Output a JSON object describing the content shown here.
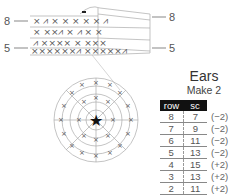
{
  "pattern": {
    "title": "Ears",
    "subtitle": "Make 2",
    "table": {
      "headers": {
        "row": "row",
        "sc": "sc"
      },
      "rows": [
        {
          "row": "8",
          "sc": "7",
          "note": "(−2)"
        },
        {
          "row": "7",
          "sc": "9",
          "note": "(−2)"
        },
        {
          "row": "6",
          "sc": "11",
          "note": "(−2)"
        },
        {
          "row": "5",
          "sc": "13",
          "note": "(−2)"
        },
        {
          "row": "4",
          "sc": "15",
          "note": "(+2)"
        },
        {
          "row": "3",
          "sc": "13",
          "note": "(+2)"
        },
        {
          "row": "2",
          "sc": "11",
          "note": "(+2)"
        },
        {
          "row": "1",
          "sc": "9",
          "note": "skr"
        }
      ]
    }
  },
  "diagram": {
    "row_labels": {
      "left_top": "8",
      "left_bottom": "5",
      "right_top": "8",
      "right_bottom": "5"
    },
    "center_symbol": "★",
    "colors": {
      "line": "#aaaaaa",
      "stitch": "#555555",
      "header_bg": "#111111"
    }
  }
}
